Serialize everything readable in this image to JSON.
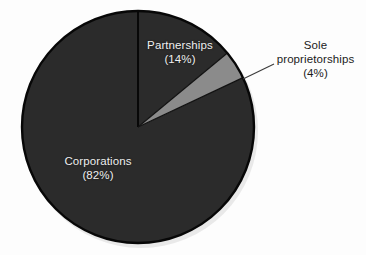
{
  "chart_data": {
    "type": "pie",
    "title": "",
    "subtitle": "",
    "xlabel": "",
    "ylabel": "",
    "grid": false,
    "legend_position": "none",
    "start_angle_deg": 0,
    "direction": "clockwise",
    "categories": [
      "Partnerships",
      "Sole proprietorships",
      "Corporations"
    ],
    "values": [
      14,
      4,
      82
    ],
    "value_unit": "percent",
    "slices": [
      {
        "name": "Partnerships",
        "label_line1": "Partnerships",
        "label_line2": "(14%)",
        "label_line3": "",
        "value": 14,
        "value_text": "(14%)",
        "color": "#2b2b2b",
        "label_placement": "inside",
        "label_color": "#efefef",
        "start_deg": 0.0,
        "end_deg": 50.4,
        "has_leader_line": false
      },
      {
        "name": "Sole proprietorships",
        "label_line1": "Sole",
        "label_line2": "proprietorships",
        "label_line3": "(4%)",
        "value": 4,
        "value_text": "(4%)",
        "color": "#8b8b8b",
        "label_placement": "outside",
        "label_color": "#1b1b1b",
        "start_deg": 50.4,
        "end_deg": 64.8,
        "has_leader_line": true
      },
      {
        "name": "Corporations",
        "label_line1": "Corporations",
        "label_line2": "(82%)",
        "label_line3": "",
        "value": 82,
        "value_text": "(82%)",
        "color": "#2b2b2b",
        "label_placement": "inside",
        "label_color": "#efefef",
        "start_deg": 64.8,
        "end_deg": 360.0,
        "has_leader_line": false
      }
    ],
    "annotations": []
  },
  "figure": {
    "background_color": "#fdfdfd",
    "outline_color": "#070707",
    "divider_color": "#000000",
    "leader_line_color": "#3c3c3c",
    "center_x": 138,
    "center_y": 127,
    "radius": 116
  }
}
